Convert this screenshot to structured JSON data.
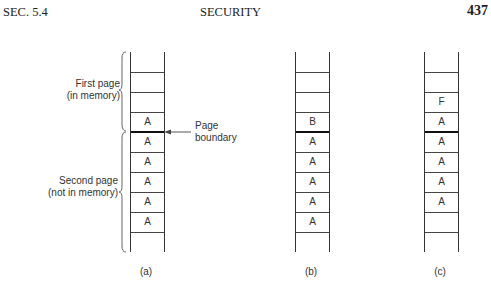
{
  "header": {
    "section": "SEC. 5.4",
    "title": "SECURITY",
    "page_number": "437"
  },
  "figure": {
    "labels": {
      "first_page": [
        "First page",
        "(in memory)"
      ],
      "second_page": [
        "Second page",
        "(not in memory)"
      ],
      "page_boundary": [
        "Page",
        "boundary"
      ]
    },
    "panels": [
      {
        "caption": "(a)",
        "cells": [
          "",
          "",
          "A",
          "A",
          "A",
          "A",
          "A",
          "A",
          ""
        ],
        "boundary_after": 3
      },
      {
        "caption": "(b)",
        "cells": [
          "",
          "",
          "B",
          "A",
          "A",
          "A",
          "A",
          "A",
          ""
        ],
        "boundary_after": 3
      },
      {
        "caption": "(c)",
        "cells": [
          "",
          "F",
          "A",
          "A",
          "A",
          "A",
          "A",
          "",
          ""
        ],
        "boundary_after": 3
      }
    ]
  }
}
